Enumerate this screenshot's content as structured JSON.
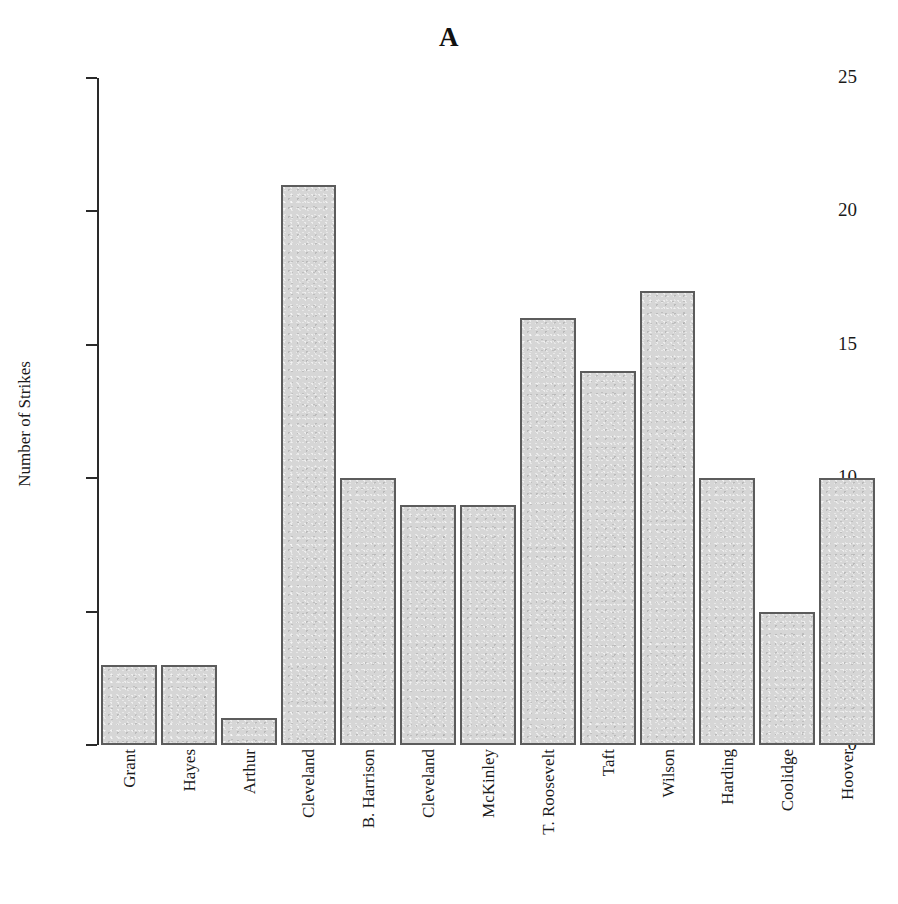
{
  "chart_data": {
    "type": "bar",
    "title": "A",
    "xlabel": "",
    "ylabel": "Number of Strikes",
    "categories": [
      "Grant",
      "Hayes",
      "Arthur",
      "Cleveland",
      "B. Harrison",
      "Cleveland",
      "McKinley",
      "T. Roosevelt",
      "Taft",
      "Wilson",
      "Harding",
      "Coolidge",
      "Hoover"
    ],
    "values": [
      3,
      3,
      1,
      21,
      10,
      9,
      9,
      16,
      14,
      17,
      10,
      5,
      10
    ],
    "ylim": [
      0,
      25
    ],
    "yticks": [
      0,
      5,
      10,
      15,
      20,
      25
    ],
    "ytick_labels": [
      "0",
      "5",
      "10",
      "15",
      "20",
      "25"
    ],
    "grid": false,
    "legend": null,
    "series": [
      {
        "name": "Number of Strikes",
        "values": [
          3,
          3,
          1,
          21,
          10,
          9,
          9,
          16,
          14,
          17,
          10,
          5,
          10
        ]
      }
    ],
    "colors": {
      "bar_fill": "#d6d6d6",
      "bar_border": "#5c5c5c",
      "axis": "#2a2a2a",
      "text": "#1a1a1a",
      "background": "#ffffff"
    }
  }
}
